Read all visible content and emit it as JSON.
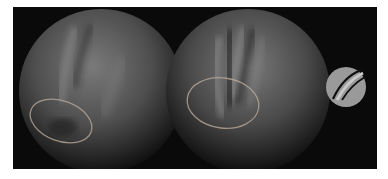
{
  "figure": {
    "background": "#0a0a0a",
    "objects": [
      {
        "name": "sphere-left",
        "description": "Gray shaded sphere with a soft vertical crease and highlighted ellipse region at lower-left"
      },
      {
        "name": "sphere-middle",
        "description": "Gray shaded sphere with a deep V-shaped groove and highlighted ellipse region at lower-left"
      },
      {
        "name": "small-sphere-icon",
        "description": "Small flat gray disc with two curved light stripes"
      }
    ],
    "colors": {
      "sphere_mid": "#6a6a6a",
      "ellipse_outline": "#b8a89a",
      "icon_fill": "#9a9a9a",
      "icon_stripe": "#c8c8c8"
    }
  }
}
